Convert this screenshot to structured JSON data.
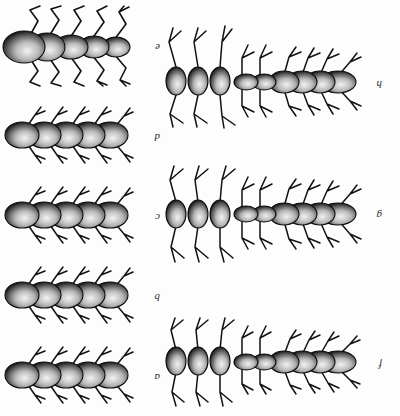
{
  "figure": {
    "kind": "scientific-plate",
    "orientation_note": "plate printed upside-down (rotated 180 degrees)",
    "background_color": "#fdfdfd",
    "ink_color": "#111111",
    "panel_count": 8
  },
  "panels": [
    {
      "id": "a",
      "label": "a",
      "column": "right",
      "row": 1,
      "body_segments": 5,
      "leg_pairs": 5,
      "leg_style": "short-forked",
      "body_form": "short-compact",
      "has_enlarged_posterior_segments": false,
      "antennae": false
    },
    {
      "id": "b",
      "label": "b",
      "column": "right",
      "row": 2,
      "body_segments": 5,
      "leg_pairs": 5,
      "leg_style": "short-forked",
      "body_form": "short-compact",
      "has_enlarged_posterior_segments": false,
      "antennae": false
    },
    {
      "id": "c",
      "label": "c",
      "column": "right",
      "row": 3,
      "body_segments": 5,
      "leg_pairs": 5,
      "leg_style": "short-forked",
      "body_form": "short-compact",
      "has_enlarged_posterior_segments": false,
      "antennae": false
    },
    {
      "id": "d",
      "label": "d",
      "column": "right",
      "row": 4,
      "body_segments": 5,
      "leg_pairs": 5,
      "leg_style": "short-forked",
      "body_form": "short-compact",
      "has_enlarged_posterior_segments": false,
      "antennae": false
    },
    {
      "id": "e",
      "label": "e",
      "column": "right",
      "row": 5,
      "body_segments": 5,
      "leg_pairs": 5,
      "leg_style": "long-geniculate",
      "body_form": "tapering-with-large-head",
      "has_enlarged_posterior_segments": false,
      "antennae": false
    },
    {
      "id": "f",
      "label": "f",
      "column": "left",
      "row": 1,
      "body_segments": 9,
      "leg_pairs": 9,
      "leg_style": "mixed-short-and-long",
      "body_form": "elongate-with-three-terminal-ovals",
      "has_enlarged_posterior_segments": true,
      "antennae": true
    },
    {
      "id": "g",
      "label": "g",
      "column": "left",
      "row": 2,
      "body_segments": 9,
      "leg_pairs": 9,
      "leg_style": "mixed-short-and-long",
      "body_form": "elongate-with-three-terminal-ovals",
      "has_enlarged_posterior_segments": true,
      "antennae": true
    },
    {
      "id": "h",
      "label": "h",
      "column": "left",
      "row": 3,
      "body_segments": 9,
      "leg_pairs": 9,
      "leg_style": "mixed-short-and-long",
      "body_form": "elongate-with-three-terminal-ovals",
      "has_enlarged_posterior_segments": true,
      "antennae": true
    }
  ]
}
